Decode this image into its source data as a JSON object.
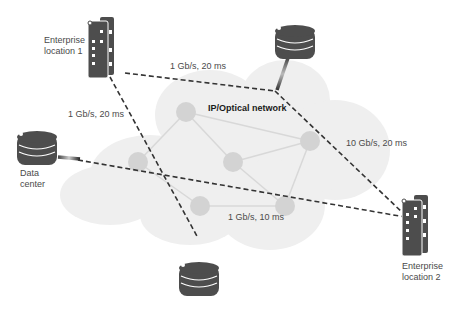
{
  "network": {
    "title": "IP/Optical network"
  },
  "sites": {
    "enterprise1": {
      "line1": "Enterprise",
      "line2": "location 1"
    },
    "enterprise2": {
      "line1": "Enterprise",
      "line2": "location 2"
    },
    "datacenter": {
      "line1": "Data",
      "line2": "center"
    }
  },
  "links": {
    "e1_to_top_db": "1 Gb/s, 20 ms",
    "e1_to_bottom_db": "1 Gb/s, 20 ms",
    "top_db_to_e2": "10 Gb/s, 20 ms",
    "dc_to_e2": "1 Gb/s, 10 ms"
  },
  "colors": {
    "cloud": "#efefef",
    "node": "#d3d3d3",
    "mesh_link": "#d8d8d8",
    "icon": "#4d4d4d",
    "dashed": "#333333"
  },
  "icons": [
    "building-icon",
    "database-icon"
  ]
}
